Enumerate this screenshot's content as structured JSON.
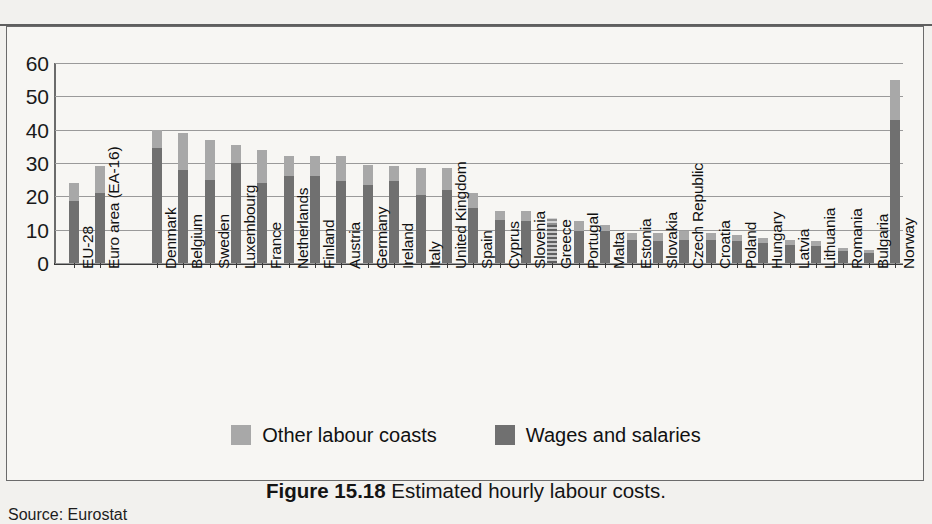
{
  "caption": {
    "figure_number": "Figure 15.18",
    "text": "Estimated hourly labour costs."
  },
  "source": "Source: Eurostat",
  "legend": {
    "items": [
      {
        "label": "Other labour coasts",
        "color": "#a8a8a8"
      },
      {
        "label": "Wages and salaries",
        "color": "#707070"
      }
    ]
  },
  "chart_data": {
    "type": "bar",
    "stacked": true,
    "title": "Estimated hourly labour costs.",
    "xlabel": "",
    "ylabel": "",
    "ylim": [
      0,
      60
    ],
    "yticks": [
      0,
      10,
      20,
      30,
      40,
      50,
      60
    ],
    "ytick_labels": [
      "0",
      "10",
      "20",
      "30",
      "40",
      "50",
      "60"
    ],
    "grid": true,
    "legend_position": "bottom-center",
    "categories": [
      "EU-28",
      "Euro area (EA-16)",
      "Denmark",
      "Belgium",
      "Sweden",
      "Luxembourg",
      "France",
      "Netherlands",
      "Finland",
      "Austria",
      "Germany",
      "Ireland",
      "Italy",
      "United Kingdom",
      "Spain",
      "Cyprus",
      "Slovenia",
      "Greece",
      "Portugal",
      "Malta",
      "Estonia",
      "Slovakia",
      "Czech Republic",
      "Croatia",
      "Poland",
      "Hungary",
      "Latvia",
      "Lithuania",
      "Romania",
      "Bulgaria",
      "Norway"
    ],
    "gaps_after": [
      "Euro area (EA-16)"
    ],
    "series": [
      {
        "name": "Wages and salaries",
        "color": "#707070",
        "values": [
          18.5,
          21.0,
          34.5,
          28.0,
          25.0,
          30.0,
          24.0,
          26.0,
          26.0,
          24.5,
          23.5,
          24.5,
          20.5,
          22.0,
          16.5,
          13.0,
          12.5,
          11.5,
          9.5,
          9.5,
          7.0,
          6.5,
          7.0,
          7.0,
          6.5,
          6.0,
          5.5,
          5.0,
          3.5,
          3.0,
          43.0
        ]
      },
      {
        "name": "Other labour coasts",
        "color": "#a8a8a8",
        "values": [
          5.5,
          8.0,
          5.5,
          11.0,
          12.0,
          5.5,
          10.0,
          6.0,
          6.0,
          7.5,
          6.0,
          4.5,
          8.0,
          6.5,
          4.5,
          2.5,
          3.0,
          2.0,
          3.0,
          2.0,
          2.0,
          2.5,
          2.5,
          2.0,
          2.0,
          1.5,
          1.5,
          1.5,
          1.0,
          1.0,
          12.0
        ]
      }
    ],
    "totals": [
      24.0,
      29.0,
      40.0,
      39.0,
      37.0,
      35.5,
      34.0,
      32.0,
      32.0,
      32.0,
      29.5,
      29.0,
      28.5,
      28.5,
      21.0,
      15.5,
      15.5,
      13.5,
      12.5,
      11.5,
      9.0,
      9.0,
      9.5,
      9.0,
      8.5,
      7.5,
      7.0,
      6.5,
      4.5,
      4.0,
      55.0
    ]
  }
}
